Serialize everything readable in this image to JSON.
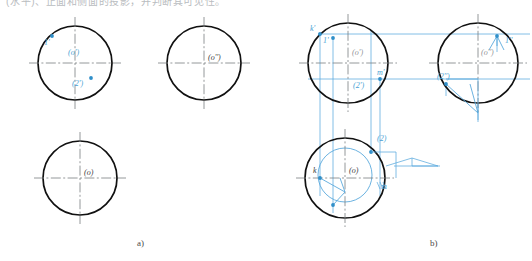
{
  "page": {
    "header_text": "(水平)、正面和侧面的投影，并判断其可见性。",
    "background": "#ffffff",
    "line_color_outline": "#111111",
    "line_color_center": "#7a7d80",
    "line_color_construction": "#5aa9dd",
    "label_color_blue": "#4a9fd4",
    "label_color_dark": "#3c3c3c"
  },
  "figures": [
    {
      "id": "a",
      "caption": "a)",
      "caption_pos": {
        "x": 137,
        "y": 240
      },
      "views": [
        {
          "name": "front-view",
          "center": {
            "x": 75,
            "y": 63
          },
          "radius": 37,
          "labels": [
            {
              "text": "1'",
              "x": 44,
              "y": 38,
              "color": "blue"
            },
            {
              "text": "(o')",
              "x": 68,
              "y": 52,
              "color": "blue"
            },
            {
              "text": "(2')",
              "x": 72,
              "y": 83,
              "color": "blue"
            }
          ],
          "points": [
            {
              "name": "point-1",
              "x": 52,
              "y": 36
            },
            {
              "name": "point-2",
              "x": 91,
              "y": 78
            }
          ]
        },
        {
          "name": "side-view",
          "center": {
            "x": 204,
            "y": 63
          },
          "radius": 37,
          "labels": [
            {
              "text": "(o'')",
              "x": 208,
              "y": 57,
              "color": "dark"
            }
          ],
          "points": []
        },
        {
          "name": "top-view",
          "center": {
            "x": 80,
            "y": 178
          },
          "radius": 37,
          "labels": [
            {
              "text": "(o)",
              "x": 84,
              "y": 172,
              "color": "dark"
            }
          ],
          "points": []
        }
      ]
    },
    {
      "id": "b",
      "caption": "b)",
      "caption_pos": {
        "x": 430,
        "y": 240
      },
      "views": [
        {
          "name": "front-view",
          "center": {
            "x": 348,
            "y": 63
          },
          "radius": 40,
          "labels": [
            {
              "text": "k'",
              "x": 310,
              "y": 28,
              "color": "blue"
            },
            {
              "text": "1'",
              "x": 323,
              "y": 40,
              "color": "blue"
            },
            {
              "text": "(o')",
              "x": 352,
              "y": 52,
              "color": "grey"
            },
            {
              "text": "m'",
              "x": 377,
              "y": 72,
              "color": "blue"
            },
            {
              "text": "(2')",
              "x": 353,
              "y": 85,
              "color": "blue"
            }
          ],
          "points": [
            {
              "name": "point-k-prime",
              "x": 320,
              "y": 34
            },
            {
              "name": "point-1-prime",
              "x": 333,
              "y": 38
            },
            {
              "name": "point-m-prime",
              "x": 380,
              "y": 79
            }
          ]
        },
        {
          "name": "side-view",
          "center": {
            "x": 478,
            "y": 63
          },
          "radius": 40,
          "labels": [
            {
              "text": "1''",
              "x": 505,
              "y": 40,
              "color": "blue"
            },
            {
              "text": "(o'')",
              "x": 481,
              "y": 52,
              "color": "grey"
            },
            {
              "text": "(2'')",
              "x": 437,
              "y": 76,
              "color": "blue"
            }
          ],
          "points": [
            {
              "name": "point-1-dblprime",
              "x": 497,
              "y": 36
            },
            {
              "name": "point-2-dblprime",
              "x": 446,
              "y": 84
            }
          ]
        },
        {
          "name": "top-view",
          "center": {
            "x": 345,
            "y": 178
          },
          "radius": 40,
          "inner_radius": 27,
          "labels": [
            {
              "text": "(2)",
              "x": 377,
              "y": 138,
              "color": "blue"
            },
            {
              "text": "k",
              "x": 313,
              "y": 170,
              "color": "dark"
            },
            {
              "text": "(o)",
              "x": 349,
              "y": 170,
              "color": "dark"
            },
            {
              "text": "m",
              "x": 381,
              "y": 186,
              "color": "blue"
            }
          ],
          "points": [
            {
              "name": "point-k",
              "x": 320,
              "y": 178
            },
            {
              "name": "point-2-top",
              "x": 371,
              "y": 152
            },
            {
              "name": "point-1-top",
              "x": 333,
              "y": 205
            }
          ]
        }
      ]
    }
  ]
}
